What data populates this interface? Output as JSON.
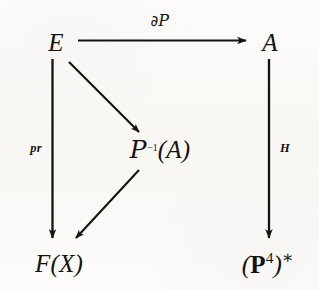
{
  "figure": {
    "kind": "commutative-diagram",
    "background_color": "#fbfaf8",
    "ink_color": "#15130f"
  },
  "nodes": {
    "top_left": {
      "name": "E",
      "text": "E"
    },
    "top_right": {
      "name": "A",
      "text": "A"
    },
    "center": {
      "name": "P-inverse-of-A",
      "base": "ᵟ",
      "script_p": "P",
      "superscript": "−1",
      "argument": "(A)"
    },
    "bottom_left": {
      "name": "F-of-X",
      "text": "F(X)"
    },
    "bottom_right": {
      "name": "P4-dual",
      "open_paren": "(",
      "bold_p": "P",
      "superscript": "4",
      "close_paren": ")",
      "star": "∗"
    }
  },
  "edges": {
    "top_horizontal": {
      "name": "E-to-A",
      "from": "E",
      "to": "A",
      "label_partial": "∂",
      "label_script_p": "P"
    },
    "left_vertical": {
      "name": "E-to-F-of-X",
      "from": "E",
      "to": "F(X)",
      "label": "pr"
    },
    "right_vertical": {
      "name": "A-to-P4-dual",
      "from": "A",
      "to": "(P⁴)*",
      "label": "H"
    },
    "diagonal_upper": {
      "name": "E-to-P-inverse-A",
      "from": "E",
      "to": "ᵟ⁻¹(A)",
      "label": ""
    },
    "diagonal_lower": {
      "name": "P-inverse-A-to-F-of-X",
      "from": "ᵟ⁻¹(A)",
      "to": "F(X)",
      "label": ""
    }
  }
}
